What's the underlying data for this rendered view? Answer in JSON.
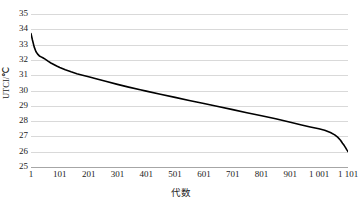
{
  "chart_data": {
    "type": "line",
    "title": "",
    "subtitle": "",
    "xlabel": "代数",
    "ylabel": "UTCI/℃",
    "xlim": [
      1,
      1101
    ],
    "ylim": [
      25,
      35
    ],
    "grid": "horizontal",
    "legend": "none",
    "line_color": "#000000",
    "gridline_color": "#d9d9d9",
    "background_color": "#ffffff",
    "ytick_labels": [
      "35",
      "34",
      "33",
      "32",
      "31",
      "30",
      "29",
      "28",
      "27",
      "26",
      "25"
    ],
    "ytick_values": [
      35,
      34,
      33,
      32,
      31,
      30,
      29,
      28,
      27,
      26,
      25
    ],
    "xtick_labels": [
      "1",
      "101",
      "201",
      "301",
      "401",
      "501",
      "601",
      "701",
      "801",
      "901",
      "1 001",
      "1 101"
    ],
    "xtick_values": [
      1,
      101,
      201,
      301,
      401,
      501,
      601,
      701,
      801,
      901,
      1001,
      1101
    ],
    "series": [
      {
        "name": "UTCI",
        "x": [
          1,
          6,
          12,
          18,
          24,
          30,
          36,
          42,
          50,
          60,
          70,
          80,
          90,
          101,
          120,
          140,
          160,
          180,
          201,
          230,
          260,
          301,
          340,
          380,
          401,
          450,
          501,
          550,
          601,
          650,
          701,
          750,
          801,
          850,
          901,
          940,
          970,
          1000,
          1020,
          1040,
          1055,
          1065,
          1075,
          1082,
          1088,
          1093,
          1097,
          1100,
          1101
        ],
        "values": [
          33.72,
          33.3,
          32.85,
          32.55,
          32.38,
          32.26,
          32.2,
          32.14,
          32.05,
          31.92,
          31.8,
          31.7,
          31.6,
          31.5,
          31.35,
          31.22,
          31.1,
          31.0,
          30.9,
          30.75,
          30.6,
          30.4,
          30.22,
          30.05,
          29.96,
          29.75,
          29.55,
          29.35,
          29.15,
          28.95,
          28.75,
          28.55,
          28.35,
          28.15,
          27.92,
          27.75,
          27.62,
          27.5,
          27.4,
          27.25,
          27.1,
          26.95,
          26.75,
          26.55,
          26.4,
          26.25,
          26.12,
          26.04,
          26.0
        ]
      }
    ]
  }
}
